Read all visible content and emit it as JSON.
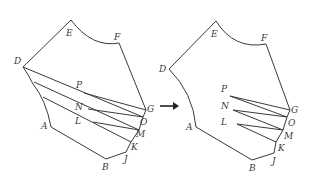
{
  "diagram": {
    "arrow": {
      "direction": "right"
    },
    "left_figure": {
      "labels": {
        "E": "E",
        "F": "F",
        "D": "D",
        "P": "P",
        "N": "N",
        "L": "L",
        "G": "G",
        "O": "O",
        "M": "M",
        "K": "K",
        "J": "J",
        "B": "B",
        "A": "A"
      }
    },
    "right_figure": {
      "labels": {
        "E": "E",
        "F": "F",
        "D": "D",
        "P": "P",
        "N": "N",
        "L": "L",
        "G": "G",
        "O": "O",
        "M": "M",
        "K": "K",
        "J": "J",
        "B": "B",
        "A": "A"
      }
    },
    "colors": {
      "stroke": "#3a3a3a",
      "background": "#ffffff"
    }
  }
}
